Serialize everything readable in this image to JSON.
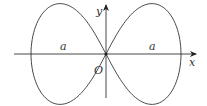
{
  "diagram": {
    "type": "lemniscate",
    "labels": {
      "x_axis": "x",
      "y_axis": "y",
      "origin": "O",
      "left_loop": "a",
      "right_loop": "a"
    },
    "geometry": {
      "origin_px": [
        106,
        54
      ],
      "half_width_px": 75
    },
    "colors": {
      "stroke": "#333333",
      "background": "#ffffff"
    }
  }
}
